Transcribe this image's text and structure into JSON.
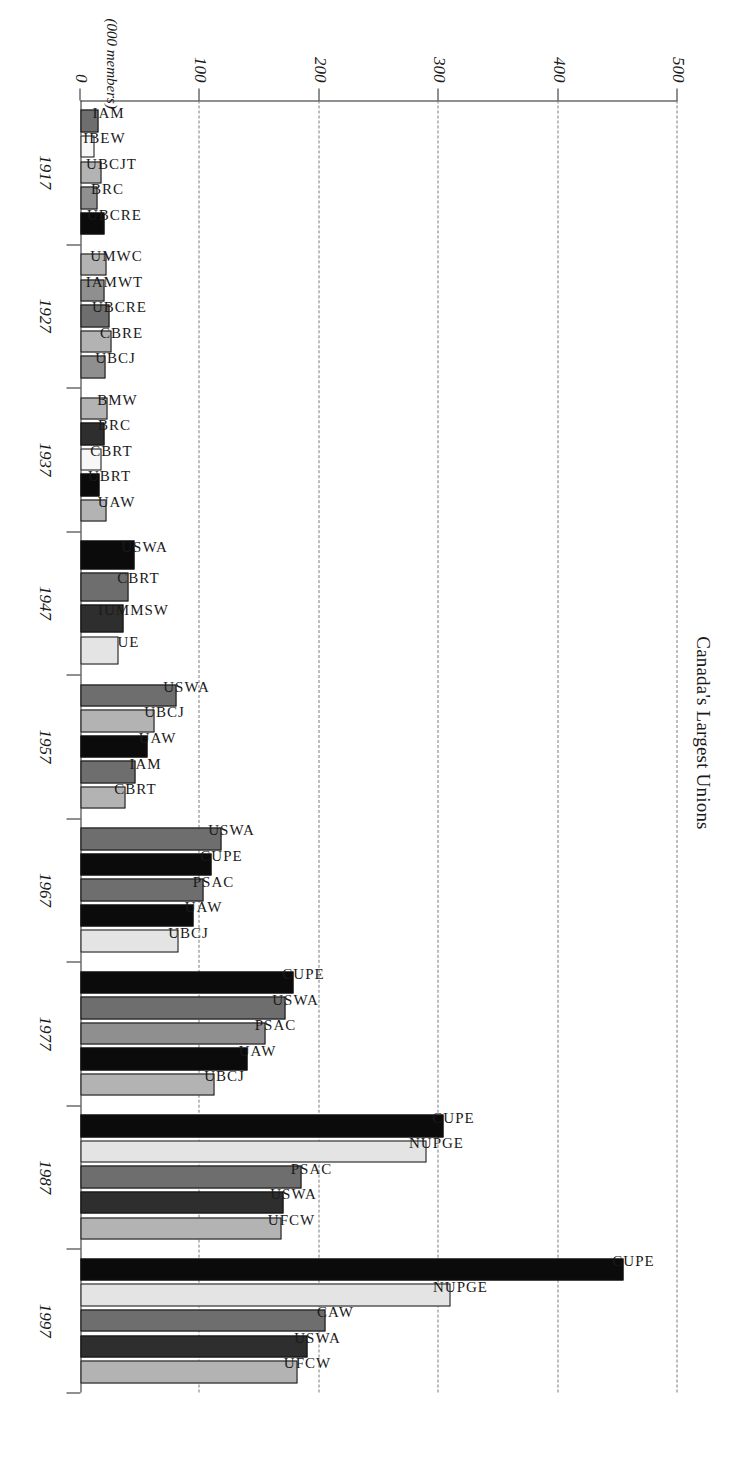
{
  "chart_data": {
    "type": "bar",
    "orientation": "horizontal",
    "title": "Canada's Largest Unions",
    "xlabel": "",
    "ylabel": "(000 members)",
    "axis_caption": "(000 members)",
    "value_axis_ticks": [
      0,
      100,
      200,
      300,
      400,
      500
    ],
    "value_axis_labels": [
      "0",
      "100",
      "200",
      "300",
      "400",
      "500"
    ],
    "ylim": [
      0,
      500
    ],
    "grid": "dashed vertical gridlines at 100, 200, 300, 400, 500",
    "legend": "none; each bar is labelled in place with its union acronym",
    "categories": [
      "1917",
      "1927",
      "1937",
      "1947",
      "1957",
      "1967",
      "1977",
      "1987",
      "1997"
    ],
    "groups": [
      {
        "category": "1917",
        "bars": [
          {
            "label": "IAM",
            "value": 15,
            "swatch": "midgrey"
          },
          {
            "label": "IBEW",
            "value": 12,
            "swatch": "white"
          },
          {
            "label": "UBCJT",
            "value": 18,
            "swatch": "grey"
          },
          {
            "label": "BRC",
            "value": 14,
            "swatch": "medium"
          },
          {
            "label": "UBCRE",
            "value": 20,
            "swatch": "black"
          }
        ]
      },
      {
        "category": "1927",
        "bars": [
          {
            "label": "UMWC",
            "value": 22,
            "swatch": "grey"
          },
          {
            "label": "IAMWT",
            "value": 20,
            "swatch": "medium"
          },
          {
            "label": "UBCRE",
            "value": 24,
            "swatch": "midgrey"
          },
          {
            "label": "CBRE",
            "value": 26,
            "swatch": "grey"
          },
          {
            "label": "UBCJ",
            "value": 21,
            "swatch": "medium"
          }
        ]
      },
      {
        "category": "1937",
        "bars": [
          {
            "label": "BMW",
            "value": 23,
            "swatch": "grey"
          },
          {
            "label": "BRC",
            "value": 20,
            "swatch": "dark"
          },
          {
            "label": "CBRT",
            "value": 18,
            "swatch": "white"
          },
          {
            "label": "UBRT",
            "value": 16,
            "swatch": "black"
          },
          {
            "label": "UAW",
            "value": 22,
            "swatch": "grey"
          }
        ]
      },
      {
        "category": "1947",
        "bars": [
          {
            "label": "USWA",
            "value": 45,
            "swatch": "black"
          },
          {
            "label": "CBRT",
            "value": 40,
            "swatch": "midgrey"
          },
          {
            "label": "IUMMSW",
            "value": 36,
            "swatch": "dark"
          },
          {
            "label": "UE",
            "value": 32,
            "swatch": "light"
          }
        ]
      },
      {
        "category": "1957",
        "bars": [
          {
            "label": "USWA",
            "value": 80,
            "swatch": "midgrey"
          },
          {
            "label": "UBCJ",
            "value": 62,
            "swatch": "grey"
          },
          {
            "label": "UAW",
            "value": 56,
            "swatch": "black"
          },
          {
            "label": "IAM",
            "value": 46,
            "swatch": "midgrey"
          },
          {
            "label": "CBRT",
            "value": 38,
            "swatch": "grey"
          }
        ]
      },
      {
        "category": "1967",
        "bars": [
          {
            "label": "USWA",
            "value": 118,
            "swatch": "midgrey"
          },
          {
            "label": "CUPE",
            "value": 110,
            "swatch": "black"
          },
          {
            "label": "PSAC",
            "value": 103,
            "swatch": "midgrey"
          },
          {
            "label": "UAW",
            "value": 95,
            "swatch": "black"
          },
          {
            "label": "UBCJ",
            "value": 82,
            "swatch": "light"
          }
        ]
      },
      {
        "category": "1977",
        "bars": [
          {
            "label": "CUPE",
            "value": 178,
            "swatch": "black"
          },
          {
            "label": "USWA",
            "value": 172,
            "swatch": "midgrey"
          },
          {
            "label": "PSAC",
            "value": 155,
            "swatch": "medium"
          },
          {
            "label": "UAW",
            "value": 140,
            "swatch": "black"
          },
          {
            "label": "UBCJ",
            "value": 112,
            "swatch": "grey"
          }
        ]
      },
      {
        "category": "1987",
        "bars": [
          {
            "label": "CUPE",
            "value": 304,
            "swatch": "black"
          },
          {
            "label": "NUPGE",
            "value": 290,
            "swatch": "light"
          },
          {
            "label": "PSAC",
            "value": 185,
            "swatch": "midgrey"
          },
          {
            "label": "USWA",
            "value": 170,
            "swatch": "dark"
          },
          {
            "label": "UFCW",
            "value": 168,
            "swatch": "grey"
          }
        ]
      },
      {
        "category": "1997",
        "bars": [
          {
            "label": "CUPE",
            "value": 455,
            "swatch": "black"
          },
          {
            "label": "NUPGE",
            "value": 310,
            "swatch": "light"
          },
          {
            "label": "CAW",
            "value": 205,
            "swatch": "midgrey"
          },
          {
            "label": "USWA",
            "value": 190,
            "swatch": "dark"
          },
          {
            "label": "UFCW",
            "value": 182,
            "swatch": "grey"
          }
        ]
      }
    ]
  },
  "colors": {
    "black": "#0b0b0b",
    "dark": "#2e2e2e",
    "midgrey": "#6e6e6e",
    "medium": "#8f8f8f",
    "grey": "#b3b3b3",
    "light": "#e4e4e4",
    "white": "#f7f7f7",
    "axis": "#222222",
    "grid": "#7a7a7a"
  }
}
